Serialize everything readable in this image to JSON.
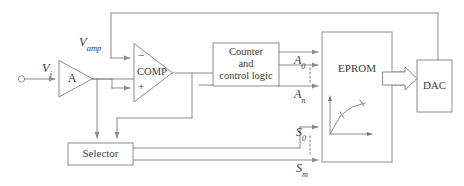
{
  "figure": {
    "type": "block-diagram",
    "background_color": "#ffffff",
    "line_color": "#8c8c8c",
    "text_color": "#3a3a3a"
  },
  "blocks": {
    "amplifier": {
      "label": "A",
      "shape": "triangle",
      "name": "amplifier-a"
    },
    "comparator": {
      "label": "COMP",
      "shape": "triangle",
      "minus": "−",
      "plus": "+"
    },
    "counter": {
      "line1": "Counter",
      "line2": "and",
      "line3": "control logic"
    },
    "eprom": {
      "label": "EPROM"
    },
    "dac": {
      "label": "DAC"
    },
    "selector": {
      "label": "Selector"
    }
  },
  "signals": {
    "input": {
      "v": "V",
      "sub": "i",
      "full": "Vi"
    },
    "amp_out": {
      "v": "V",
      "sub": "amp",
      "full": "Vamp"
    },
    "address_first": {
      "v": "A",
      "sub": "0",
      "full": "A0"
    },
    "address_last": {
      "v": "A",
      "sub": "n",
      "full": "An"
    },
    "select_first": {
      "v": "S",
      "sub": "0",
      "full": "S0"
    },
    "select_last": {
      "v": "S",
      "sub": "m",
      "full": "Sm"
    }
  },
  "icons": {
    "input_terminal": "open-circle-terminal",
    "bus_arrow": "thick-block-arrow",
    "eprom_curve": "transfer-curve-plot",
    "vertical_dots": "ellipsis-vertical"
  }
}
